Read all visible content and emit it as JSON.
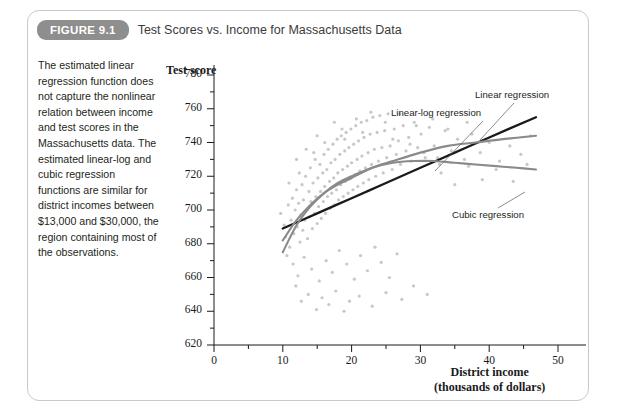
{
  "figure": {
    "badge": "FIGURE 9.1",
    "title": "Test Scores vs. Income for Massachusetts Data"
  },
  "caption": {
    "text": "The estimated linear regression function does not capture the nonlinear relation between income and test scores in the Massachusetts data. The estimated linear-log and cubic regression functions are similar for district incomes between $13,000 and $30,000, the region containing most of the observations."
  },
  "annotations": [
    {
      "name": "linear-regression",
      "label": "Linear regression"
    },
    {
      "name": "linear-log-regression",
      "label": "Linear-log regression"
    },
    {
      "name": "cubic-regression",
      "label": "Cubic regression"
    }
  ],
  "chart_data": {
    "type": "scatter",
    "title": "Test Scores vs. Income for Massachusetts Data",
    "xlabel": "District income",
    "xlabel_sub": "(thousands of dollars)",
    "ylabel": "Test score",
    "xlim": [
      0,
      50
    ],
    "ylim": [
      620,
      780
    ],
    "xticks": [
      0,
      10,
      20,
      30,
      40,
      50
    ],
    "xminor_step": 5,
    "yticks": [
      620,
      640,
      660,
      680,
      700,
      720,
      740,
      760,
      780
    ],
    "yminor_step": 10,
    "grid": false,
    "legend": "annotated-inline",
    "point_color": "#c8c8c8",
    "point_radius": 1.6,
    "scatter": [
      [
        9.7,
        698
      ],
      [
        10.2,
        691
      ],
      [
        10.4,
        684
      ],
      [
        10.8,
        703
      ],
      [
        11.0,
        678
      ],
      [
        11.2,
        694
      ],
      [
        11.4,
        707
      ],
      [
        11.6,
        686
      ],
      [
        11.8,
        700
      ],
      [
        12.0,
        712
      ],
      [
        12.1,
        690
      ],
      [
        12.3,
        704
      ],
      [
        12.5,
        681
      ],
      [
        12.6,
        697
      ],
      [
        12.8,
        715
      ],
      [
        12.9,
        688
      ],
      [
        13.0,
        706
      ],
      [
        13.2,
        694
      ],
      [
        13.3,
        720
      ],
      [
        13.5,
        700
      ],
      [
        13.6,
        683
      ],
      [
        13.8,
        711
      ],
      [
        13.9,
        696
      ],
      [
        14.0,
        725
      ],
      [
        14.1,
        705
      ],
      [
        14.3,
        689
      ],
      [
        14.4,
        716
      ],
      [
        14.6,
        698
      ],
      [
        14.7,
        730
      ],
      [
        14.8,
        708
      ],
      [
        15.0,
        692
      ],
      [
        15.1,
        719
      ],
      [
        15.2,
        702
      ],
      [
        15.4,
        727
      ],
      [
        15.5,
        711
      ],
      [
        15.6,
        695
      ],
      [
        15.8,
        722
      ],
      [
        15.9,
        705
      ],
      [
        16.0,
        733
      ],
      [
        16.1,
        714
      ],
      [
        16.2,
        698
      ],
      [
        16.4,
        724
      ],
      [
        16.5,
        708
      ],
      [
        16.6,
        736
      ],
      [
        16.8,
        717
      ],
      [
        16.9,
        701
      ],
      [
        17.0,
        728
      ],
      [
        17.1,
        710
      ],
      [
        17.3,
        739
      ],
      [
        17.4,
        719
      ],
      [
        17.5,
        703
      ],
      [
        17.6,
        730
      ],
      [
        17.8,
        712
      ],
      [
        17.9,
        742
      ],
      [
        18.0,
        722
      ],
      [
        18.1,
        706
      ],
      [
        18.3,
        733
      ],
      [
        18.4,
        715
      ],
      [
        18.5,
        744
      ],
      [
        18.7,
        724
      ],
      [
        18.8,
        708
      ],
      [
        19.0,
        735
      ],
      [
        19.1,
        717
      ],
      [
        19.2,
        746
      ],
      [
        19.4,
        726
      ],
      [
        19.5,
        710
      ],
      [
        19.6,
        737
      ],
      [
        19.8,
        719
      ],
      [
        19.9,
        748
      ],
      [
        20.0,
        728
      ],
      [
        20.2,
        712
      ],
      [
        20.3,
        739
      ],
      [
        20.5,
        721
      ],
      [
        20.6,
        750
      ],
      [
        20.8,
        730
      ],
      [
        20.9,
        714
      ],
      [
        21.0,
        741
      ],
      [
        21.2,
        723
      ],
      [
        21.4,
        752
      ],
      [
        21.5,
        732
      ],
      [
        21.7,
        716
      ],
      [
        21.8,
        743
      ],
      [
        22.0,
        725
      ],
      [
        22.2,
        753
      ],
      [
        22.4,
        734
      ],
      [
        22.5,
        718
      ],
      [
        22.7,
        745
      ],
      [
        22.9,
        727
      ],
      [
        23.1,
        755
      ],
      [
        23.3,
        736
      ],
      [
        23.5,
        720
      ],
      [
        23.7,
        746
      ],
      [
        23.9,
        729
      ],
      [
        24.1,
        756
      ],
      [
        24.4,
        737
      ],
      [
        24.6,
        722
      ],
      [
        24.8,
        747
      ],
      [
        25.1,
        731
      ],
      [
        25.3,
        757
      ],
      [
        25.6,
        738
      ],
      [
        25.9,
        724
      ],
      [
        26.2,
        748
      ],
      [
        26.5,
        733
      ],
      [
        26.8,
        741
      ],
      [
        27.1,
        727
      ],
      [
        27.5,
        750
      ],
      [
        27.9,
        735
      ],
      [
        28.3,
        743
      ],
      [
        28.7,
        729
      ],
      [
        29.1,
        752
      ],
      [
        29.6,
        737
      ],
      [
        30.1,
        745
      ],
      [
        30.7,
        731
      ],
      [
        31.3,
        749
      ],
      [
        32.0,
        738
      ],
      [
        32.8,
        727
      ],
      [
        33.6,
        747
      ],
      [
        34.5,
        735
      ],
      [
        35.4,
        742
      ],
      [
        36.4,
        730
      ],
      [
        37.5,
        745
      ],
      [
        38.7,
        734
      ],
      [
        40.0,
        740
      ],
      [
        41.5,
        729
      ],
      [
        43.0,
        738
      ],
      [
        44.6,
        733
      ],
      [
        46.0,
        744
      ],
      [
        11.5,
        668
      ],
      [
        12.2,
        661
      ],
      [
        13.1,
        672
      ],
      [
        14.2,
        665
      ],
      [
        15.3,
        658
      ],
      [
        16.3,
        670
      ],
      [
        17.2,
        663
      ],
      [
        18.2,
        676
      ],
      [
        19.3,
        668
      ],
      [
        20.4,
        659
      ],
      [
        21.3,
        673
      ],
      [
        22.3,
        664
      ],
      [
        23.4,
        678
      ],
      [
        24.3,
        669
      ],
      [
        25.5,
        660
      ],
      [
        26.6,
        674
      ],
      [
        10.6,
        673
      ],
      [
        11.9,
        655
      ],
      [
        13.7,
        650
      ],
      [
        15.7,
        648
      ],
      [
        17.7,
        652
      ],
      [
        19.7,
        646
      ],
      [
        12.7,
        646
      ],
      [
        14.9,
        641
      ],
      [
        16.7,
        644
      ],
      [
        18.9,
        640
      ],
      [
        21.1,
        649
      ],
      [
        23.0,
        643
      ],
      [
        25.0,
        651
      ],
      [
        27.3,
        647
      ],
      [
        29.0,
        655
      ],
      [
        31.0,
        650
      ],
      [
        33.0,
        722
      ],
      [
        35.0,
        715
      ],
      [
        37.0,
        726
      ],
      [
        39.0,
        718
      ],
      [
        41.0,
        724
      ],
      [
        43.5,
        717
      ],
      [
        45.5,
        727
      ],
      [
        10.9,
        716
      ],
      [
        12.4,
        722
      ],
      [
        14.5,
        734
      ],
      [
        16.1,
        740
      ],
      [
        18.6,
        748
      ],
      [
        20.7,
        754
      ],
      [
        22.8,
        758
      ],
      [
        24.9,
        752
      ],
      [
        27.0,
        757
      ],
      [
        29.4,
        750
      ],
      [
        31.8,
        754
      ],
      [
        34.0,
        748
      ],
      [
        36.8,
        752
      ],
      [
        12.0,
        730
      ],
      [
        13.4,
        736
      ],
      [
        15.0,
        744
      ],
      [
        17.5,
        752
      ],
      [
        19.0,
        742
      ],
      [
        21.6,
        746
      ],
      [
        26.0,
        742
      ],
      [
        28.5,
        739
      ],
      [
        30.5,
        734
      ],
      [
        32.5,
        731
      ]
    ],
    "curves": [
      {
        "name": "linear-regression",
        "color": "#1a1a1a",
        "width": 2.3,
        "points": [
          [
            10,
            689
          ],
          [
            15,
            698
          ],
          [
            20,
            707
          ],
          [
            25,
            716
          ],
          [
            30,
            725
          ],
          [
            35,
            734
          ],
          [
            40,
            743
          ],
          [
            46.8,
            755
          ]
        ]
      },
      {
        "name": "linear-log-regression",
        "color": "#8a8a8a",
        "width": 2.1,
        "points": [
          [
            10,
            682
          ],
          [
            12,
            694
          ],
          [
            14,
            703
          ],
          [
            16,
            710
          ],
          [
            18,
            715
          ],
          [
            20,
            719
          ],
          [
            23,
            725
          ],
          [
            26,
            729
          ],
          [
            30,
            734
          ],
          [
            34,
            738
          ],
          [
            38,
            740
          ],
          [
            42,
            742
          ],
          [
            46.8,
            744
          ]
        ]
      },
      {
        "name": "cubic-regression",
        "color": "#8a8a8a",
        "width": 2.1,
        "points": [
          [
            10,
            675
          ],
          [
            12,
            691
          ],
          [
            14,
            702
          ],
          [
            16,
            710
          ],
          [
            18,
            716
          ],
          [
            20,
            720
          ],
          [
            23,
            725
          ],
          [
            26,
            728
          ],
          [
            29,
            729
          ],
          [
            32,
            729
          ],
          [
            35,
            728
          ],
          [
            38,
            727
          ],
          [
            41,
            726
          ],
          [
            44,
            725
          ],
          [
            46.8,
            724
          ]
        ]
      }
    ]
  }
}
